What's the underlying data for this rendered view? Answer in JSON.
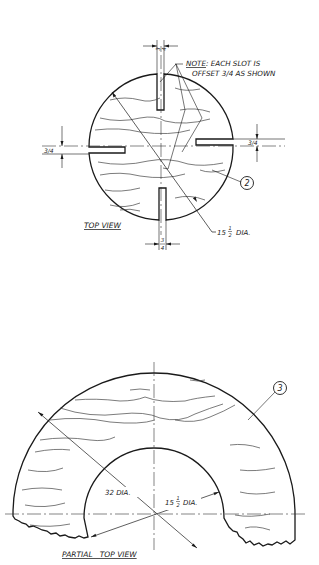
{
  "drawing": {
    "top_view": {
      "title": "TOP VIEW",
      "note_label": "NOTE",
      "note_line1": ": EACH SLOT IS",
      "note_line2": "OFFSET 3/4 AS SHOWN",
      "slot_dim_top_num": "3",
      "slot_dim_top_den": "4",
      "slot_dim_left": "3/4",
      "slot_dim_right": "3/4",
      "slot_dim_bottom_num": "3",
      "slot_dim_bottom_den": "4",
      "diameter_whole": "15",
      "diameter_frac_num": "1",
      "diameter_frac_den": "2",
      "diameter_suffix": "DIA.",
      "part_balloon": "2"
    },
    "partial_top_view": {
      "title": "PARTIAL   TOP VIEW",
      "outer_diameter": "32 DIA.",
      "inner_diameter_whole": "15",
      "inner_diameter_frac_num": "1",
      "inner_diameter_frac_den": "2",
      "inner_diameter_suffix": "DIA.",
      "part_balloon": "3"
    }
  }
}
